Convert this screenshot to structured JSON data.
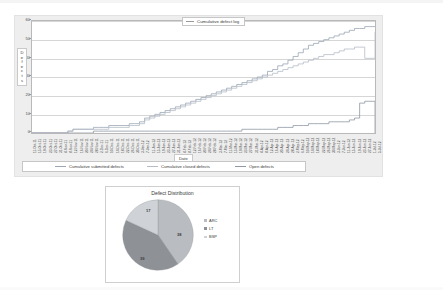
{
  "chart_data": [
    {
      "type": "line",
      "title": "Cumulative defect log",
      "xlabel": "Date",
      "ylabel": "Defects",
      "ylim": [
        0,
        60
      ],
      "yticks": [
        0,
        10,
        20,
        30,
        40,
        50,
        60
      ],
      "grid": true,
      "legend_position": "bottom",
      "x": [
        "11-Oct-11",
        "15-Oct-11",
        "19-Oct-11",
        "23-Oct-11",
        "27-Oct-11",
        "31-Oct-11",
        "4-Nov-11",
        "8-Nov-11",
        "12-Nov-11",
        "16-Nov-11",
        "20-Nov-11",
        "24-Nov-11",
        "28-Nov-11",
        "2-Dec-11",
        "6-Dec-11",
        "10-Dec-11",
        "14-Dec-11",
        "18-Dec-11",
        "22-Dec-11",
        "26-Dec-11",
        "30-Dec-11",
        "3-Jan-12",
        "7-Jan-12",
        "11-Jan-12",
        "15-Jan-12",
        "19-Jan-12",
        "23-Jan-12",
        "27-Jan-12",
        "31-Jan-12",
        "4-Feb-12",
        "8-Feb-12",
        "12-Feb-12",
        "16-Feb-12",
        "20-Feb-12",
        "24-Feb-12",
        "28-Feb-12",
        "3-Mar-12",
        "7-Mar-12",
        "11-Mar-12",
        "15-Mar-12",
        "19-Mar-12",
        "23-Mar-12",
        "27-Mar-12",
        "31-Mar-12",
        "4-Apr-12",
        "8-Apr-12",
        "12-Apr-12",
        "16-Apr-12",
        "20-Apr-12",
        "24-Apr-12",
        "28-Apr-12",
        "2-May-12",
        "6-May-12",
        "10-May-12",
        "14-May-12",
        "18-May-12",
        "22-May-12",
        "26-May-12",
        "30-May-12",
        "3-Jun-12",
        "7-Jun-12",
        "11-Jun-12",
        "15-Jun-12",
        "19-Jun-12",
        "23-Jun-12",
        "27-Jun-12",
        "1-Jul-12",
        "5-Jul-12"
      ],
      "series": [
        {
          "name": "Cumulative submitted defects",
          "color": "#9aa6b4",
          "values": [
            0,
            0,
            0,
            0,
            0,
            0,
            0,
            1,
            2,
            2,
            2,
            2,
            3,
            3,
            3,
            4,
            4,
            4,
            4,
            5,
            5,
            6,
            8,
            9,
            10,
            11,
            12,
            13,
            14,
            15,
            16,
            17,
            18,
            19,
            20,
            21,
            22,
            23,
            24,
            25,
            26,
            27,
            28,
            29,
            30,
            31,
            33,
            34,
            36,
            37,
            39,
            41,
            43,
            45,
            47,
            48,
            49,
            50,
            51,
            52,
            53,
            54,
            55,
            56,
            56,
            57,
            57,
            57
          ]
        },
        {
          "name": "Cumulative closed defects",
          "color": "#b5bcc6",
          "values": [
            0,
            0,
            0,
            0,
            0,
            0,
            0,
            1,
            2,
            2,
            2,
            2,
            2,
            2,
            2,
            3,
            3,
            3,
            3,
            4,
            4,
            5,
            7,
            8,
            9,
            10,
            11,
            12,
            13,
            14,
            15,
            16,
            17,
            18,
            19,
            20,
            21,
            22,
            23,
            24,
            25,
            26,
            27,
            28,
            29,
            30,
            31,
            32,
            33,
            34,
            35,
            36,
            37,
            38,
            39,
            40,
            41,
            42,
            42,
            43,
            44,
            45,
            45,
            46,
            46,
            40,
            40,
            54
          ]
        },
        {
          "name": "Open defects",
          "color": "#8f98a4",
          "values": [
            0,
            0,
            0,
            0,
            0,
            0,
            0,
            0,
            0,
            0,
            0,
            0,
            1,
            1,
            1,
            1,
            1,
            1,
            1,
            1,
            1,
            1,
            1,
            1,
            1,
            1,
            1,
            1,
            1,
            1,
            1,
            1,
            1,
            1,
            1,
            1,
            1,
            1,
            1,
            1,
            1,
            2,
            2,
            2,
            2,
            2,
            2,
            2,
            3,
            3,
            3,
            4,
            4,
            4,
            5,
            5,
            5,
            5,
            6,
            6,
            6,
            6,
            7,
            8,
            16,
            17,
            17,
            0
          ]
        }
      ]
    },
    {
      "type": "pie",
      "title": "Defect Distribution",
      "labels": [
        "ARC",
        "LT",
        "BSP"
      ],
      "values": [
        38,
        39,
        17
      ],
      "colors": [
        "#b9bcc1",
        "#8e9196",
        "#cfd2d6"
      ],
      "legend_position": "right",
      "data_labels": [
        "38",
        "39",
        "17"
      ]
    }
  ],
  "line_chart": {
    "title": "Cumulative defect log",
    "y_axis_title": "Defects",
    "x_axis_title": "Date",
    "y_ticks": [
      "60",
      "50",
      "40",
      "30",
      "20",
      "10",
      "0"
    ],
    "legend": [
      {
        "label": "Cumulative submitted defects",
        "color": "#9aa6b4"
      },
      {
        "label": "Cumulative closed defects",
        "color": "#b5bcc6"
      },
      {
        "label": "Open defects",
        "color": "#8f98a4"
      }
    ]
  },
  "pie_chart": {
    "title": "Defect Distribution",
    "slice_labels": [
      "17",
      "38",
      "39"
    ],
    "legend": [
      {
        "label": "ARC",
        "color": "#b9bcc1"
      },
      {
        "label": "LT",
        "color": "#8e9196"
      },
      {
        "label": "BSP",
        "color": "#cfd2d6"
      }
    ]
  }
}
